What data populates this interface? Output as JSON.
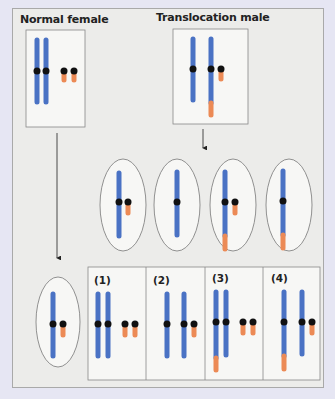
{
  "labels": {
    "normal_female": "Normal female",
    "translocation_male": "Translocation male"
  },
  "colors": {
    "background": "#e6e6f3",
    "panel": "#ececea",
    "chromosome_blue": "#4a72c4",
    "chromosome_orange": "#ec8a55",
    "centromere": "#111111",
    "box_fill": "#f7f7f5"
  },
  "offspring": {
    "labels": [
      "(1)",
      "(2)",
      "(3)",
      "(4)"
    ]
  }
}
